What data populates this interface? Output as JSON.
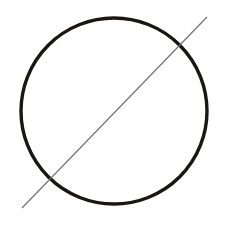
{
  "canvas": {
    "width": 229,
    "height": 225,
    "background_color": "#ffffff",
    "description": "Geometric line drawing: a circle crossed by a diagonal line"
  },
  "figure": {
    "title": "",
    "shapes": [
      {
        "name": "outline-circle",
        "type": "circle",
        "center_x": 114,
        "center_y": 111,
        "radius": 93,
        "stroke_color": "#1a1614",
        "stroke_width": 3.4,
        "fill": "none"
      },
      {
        "name": "diagonal-line",
        "type": "line",
        "x1": 22,
        "y1": 208,
        "x2": 207,
        "y2": 17,
        "stroke_color": "#6f6f6f",
        "stroke_width": 1.1,
        "fill": "none"
      }
    ],
    "intersections": [
      {
        "name": "upper-right-crossing",
        "x": 184,
        "y": 42
      },
      {
        "name": "lower-left-crossing",
        "x": 45,
        "y": 182
      }
    ]
  }
}
